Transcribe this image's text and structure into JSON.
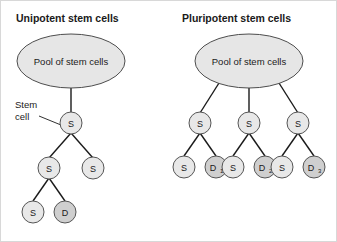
{
  "figure": {
    "background_color": "#ffffff",
    "stroke_color": "#1a1a1a",
    "s_node_color": "#e8e8e8",
    "d_node_color": "#cfcfcf",
    "pool_color": "#e6e6e6"
  },
  "panels": {
    "left": {
      "title": "Unipotent stem cells",
      "pool_label": "Pool of stem cells",
      "callout_line1": "Stem",
      "callout_line2": "cell",
      "nodes": {
        "root": "S",
        "gen2_left": "S",
        "gen2_right": "S",
        "gen3_left": "S",
        "gen3_right": "D"
      }
    },
    "right": {
      "title": "Pluripotent stem cells",
      "pool_label": "Pool of stem cells",
      "nodes": {
        "branch1": "S",
        "branch2": "S",
        "branch3": "S",
        "leaf1_s": "S",
        "leaf1_d": "D",
        "leaf1_d_sub": "1",
        "leaf2_s": "S",
        "leaf2_d": "D",
        "leaf2_d_sub": "2",
        "leaf3_s": "S",
        "leaf3_d": "D",
        "leaf3_d_sub": "3"
      }
    }
  }
}
